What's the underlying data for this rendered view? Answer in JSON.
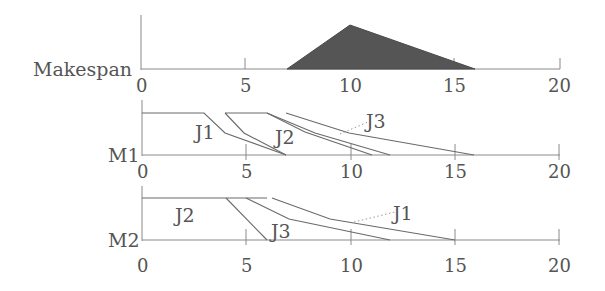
{
  "diagram": {
    "x_axis": {
      "min": 0,
      "max": 20,
      "ticks": [
        "0",
        "5",
        "10",
        "15",
        "20"
      ]
    },
    "panels": [
      {
        "id": "makespan",
        "label": "Makespan",
        "shape": "triangle",
        "fill": "#555555",
        "points": [
          [
            7,
            0
          ],
          [
            10,
            1
          ],
          [
            16,
            0
          ]
        ]
      },
      {
        "id": "M1",
        "label": "M1",
        "jobs": [
          {
            "label": "J1",
            "polyline": [
              [
                0,
                1
              ],
              [
                3.2,
                1
              ],
              [
                4,
                0.6
              ],
              [
                7,
                0
              ]
            ]
          },
          {
            "label": "J2",
            "polyline": [
              [
                4,
                1
              ],
              [
                5,
                0.6
              ],
              [
                7,
                0
              ]
            ]
          },
          {
            "label": "J2b",
            "polyline": [
              [
                6,
                1
              ],
              [
                8.5,
                0.6
              ],
              [
                11,
                0
              ]
            ]
          },
          {
            "label": "J3a",
            "polyline": [
              [
                4,
                1
              ],
              [
                6,
                1
              ],
              [
                8,
                0.6
              ],
              [
                12,
                0
              ]
            ]
          },
          {
            "label": "J3",
            "polyline": [
              [
                6.5,
                1
              ],
              [
                9.5,
                0.55
              ],
              [
                16,
                0
              ]
            ]
          }
        ],
        "job_labels": [
          "J1",
          "J2",
          "J3"
        ]
      },
      {
        "id": "M2",
        "label": "M2",
        "jobs": [
          {
            "label": "J2",
            "polyline": [
              [
                0,
                1
              ],
              [
                4,
                1
              ],
              [
                6,
                0
              ]
            ]
          },
          {
            "label": "J3",
            "polyline": [
              [
                5,
                1
              ],
              [
                7,
                0.6
              ],
              [
                12,
                0
              ]
            ]
          },
          {
            "label": "J1",
            "polyline": [
              [
                7,
                1
              ],
              [
                10,
                0.6
              ],
              [
                15,
                0
              ]
            ]
          }
        ],
        "job_labels": [
          "J2",
          "J3",
          "J1"
        ]
      }
    ]
  },
  "text": {
    "makespan_label": "Makespan",
    "m1_label": "M1",
    "m2_label": "M2",
    "m1_j1": "J1",
    "m1_j2": "J2",
    "m1_j3": "J3",
    "m2_j2": "J2",
    "m2_j3": "J3",
    "m2_j1": "J1",
    "ticks": [
      "0",
      "5",
      "10",
      "15",
      "20"
    ]
  }
}
